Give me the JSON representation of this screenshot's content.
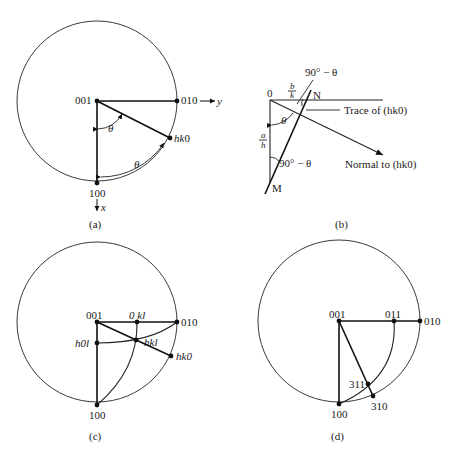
{
  "panels": {
    "a": {
      "caption": "(a)",
      "poles": {
        "p001": "001",
        "p010": "010",
        "p100": "100",
        "phk0_h": "h",
        "phk0_k": "k",
        "phk0_0": "0"
      },
      "axes": {
        "y": "y",
        "x": "x"
      },
      "angles": {
        "theta1": "θ",
        "theta2": "θ"
      }
    },
    "b": {
      "caption": "(b)",
      "labels": {
        "origin": "0",
        "N": "N",
        "M": "M",
        "b_over_k_num": "b",
        "b_over_k_den": "k",
        "a_over_h_num": "a",
        "a_over_h_den": "h",
        "theta": "θ",
        "angle_top": "90° − θ",
        "angle_bottom": "90° − θ",
        "trace": "Trace of (hk0)",
        "normal": "Normal to (hk0)"
      }
    },
    "c": {
      "caption": "(c)",
      "poles": {
        "p001": "001",
        "p010": "010",
        "p100": "100",
        "p0kl": "0 kl",
        "phkl": "hkl",
        "ph0l": "h0l",
        "phk0": "hk0"
      }
    },
    "d": {
      "caption": "(d)",
      "poles": {
        "p001": "001",
        "p011": "011",
        "p010": "010",
        "p100": "100",
        "p311": "311",
        "p310": "310"
      }
    }
  }
}
